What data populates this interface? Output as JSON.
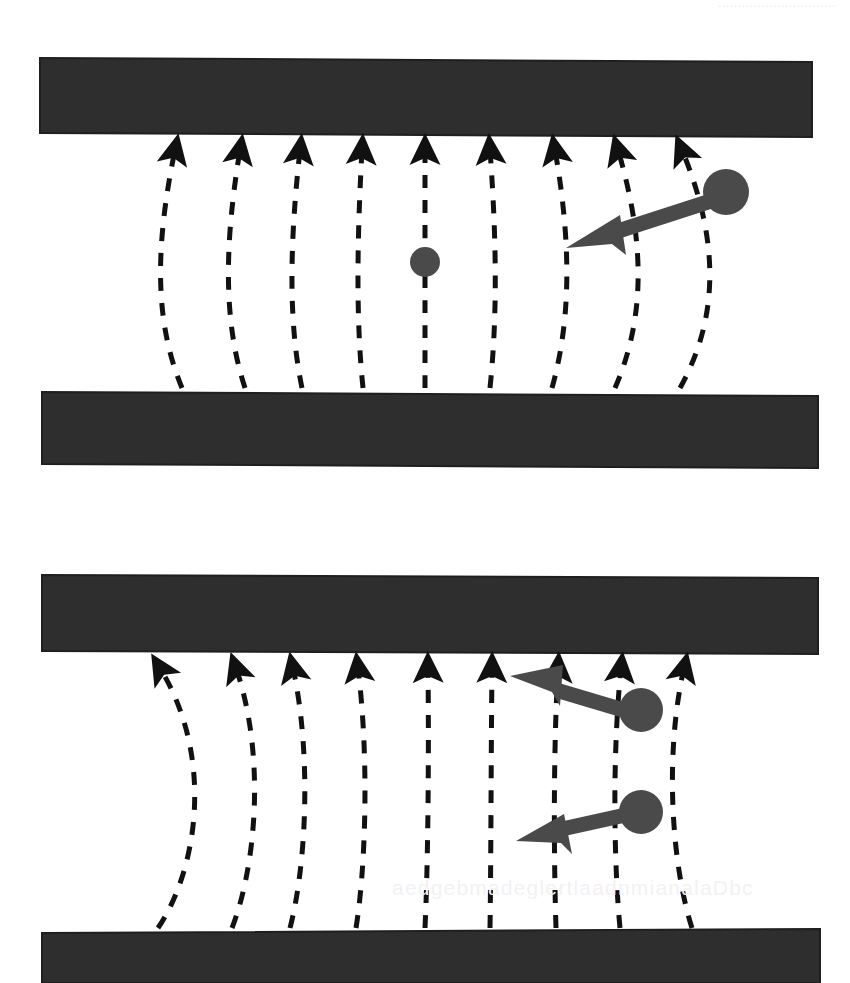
{
  "page": {
    "background_color": "#ffffff",
    "width": 850,
    "height": 983,
    "watermark_top": "..............................",
    "watermark_bottom": "aedgebmadeglertlaadnmianalaDbc"
  },
  "palette": {
    "plate_fill": "#2e2e2e",
    "plate_stroke": "#1a1a1a",
    "field_line_color": "#111111",
    "arrow_color": "#4a4a4a",
    "charge_fill": "#4a4a4a",
    "background": "#ffffff"
  },
  "figures": [
    {
      "id": "figure-single-charge",
      "caption": "",
      "plates": [
        {
          "name": "top-plate",
          "x": 40,
          "y": 58,
          "width": 772,
          "height": 76,
          "skew": "slight-downward-right"
        },
        {
          "name": "bottom-plate",
          "x": 42,
          "y": 390,
          "width": 776,
          "height": 76,
          "skew": "slight-downward-right"
        }
      ],
      "field_lines": {
        "count": 9,
        "style": "dashed",
        "direction": "upward",
        "arrowhead_at": "top",
        "bulge": "leftward-at-midheight",
        "top_x": [
          175,
          240,
          300,
          362,
          425,
          490,
          555,
          618,
          680
        ],
        "bottom_x": [
          182,
          245,
          302,
          363,
          425,
          490,
          552,
          615,
          680
        ],
        "bulge_offset": [
          -26,
          -18,
          -12,
          -6,
          0,
          8,
          18,
          30,
          44
        ]
      },
      "charges": [
        {
          "name": "test-charge-center",
          "cx": 425,
          "cy": 262,
          "r": 15,
          "label": ""
        },
        {
          "name": "source-charge-right",
          "cx": 726,
          "cy": 192,
          "r": 23,
          "label": ""
        }
      ],
      "force_vectors": [
        {
          "name": "force-vector-right-charge",
          "from_x": 712,
          "from_y": 201,
          "to_x": 568,
          "to_y": 248,
          "thickness": 15,
          "head_length": 46,
          "head_width": 40
        }
      ]
    },
    {
      "id": "figure-two-charges",
      "caption": "",
      "plates": [
        {
          "name": "top-plate",
          "x": 42,
          "y": 575,
          "width": 776,
          "height": 78,
          "skew": "slight-downward-right"
        },
        {
          "name": "bottom-plate",
          "x": 42,
          "y": 930,
          "width": 778,
          "height": 53,
          "skew": "slight-downward-right"
        }
      ],
      "field_lines": {
        "count": 9,
        "style": "dashed",
        "direction": "upward",
        "arrowhead_at": "top",
        "bulge": "rightward-at-midheight",
        "top_x": [
          158,
          235,
          292,
          358,
          428,
          492,
          558,
          620,
          683
        ],
        "bottom_x": [
          158,
          232,
          290,
          356,
          425,
          490,
          556,
          620,
          690
        ],
        "bulge_offset": [
          52,
          26,
          14,
          6,
          0,
          -2,
          -4,
          -8,
          -14
        ]
      },
      "charges": [
        {
          "name": "charge-upper",
          "cx": 641,
          "cy": 710,
          "r": 22,
          "label": ""
        },
        {
          "name": "charge-lower",
          "cx": 641,
          "cy": 812,
          "r": 22,
          "label": ""
        }
      ],
      "force_vectors": [
        {
          "name": "force-vector-upper-charge",
          "from_x": 628,
          "from_y": 712,
          "to_x": 512,
          "to_y": 676,
          "thickness": 15,
          "head_length": 46,
          "head_width": 42
        },
        {
          "name": "force-vector-lower-charge",
          "from_x": 628,
          "from_y": 815,
          "to_x": 518,
          "to_y": 840,
          "thickness": 15,
          "head_length": 46,
          "head_width": 42
        }
      ]
    }
  ]
}
